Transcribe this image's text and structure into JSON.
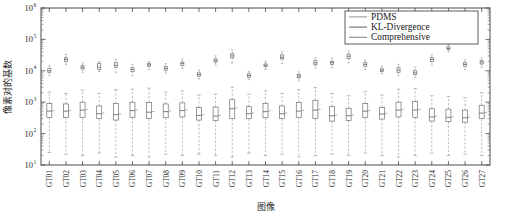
{
  "chart_data": {
    "type": "box",
    "title": "",
    "xlabel": "图像",
    "ylabel": "像素对的基数",
    "yscale": "log",
    "ylim": [
      10,
      1000000
    ],
    "ytick_labels": [
      "10",
      "10",
      "10",
      "10",
      "10",
      "10"
    ],
    "ytick_exponents": [
      "1",
      "2",
      "3",
      "4",
      "5",
      "6"
    ],
    "ytick_values": [
      10,
      100,
      1000,
      10000,
      100000,
      1000000
    ],
    "grid": false,
    "legend_position": "top-right",
    "legend": [
      {
        "label": "PDMS",
        "color": "#9a9a9a"
      },
      {
        "label": "KL-Divergence",
        "color": "#6e6e6e"
      },
      {
        "label": "Comprehensive",
        "color": "#8c8c8c"
      }
    ],
    "categories": [
      "GT01",
      "GT02",
      "GT03",
      "GT04",
      "GT05",
      "GT06",
      "GT07",
      "GT08",
      "GT09",
      "GT10",
      "GT11",
      "GT12",
      "GT13",
      "GT14",
      "GT15",
      "GT16",
      "GT17",
      "GT18",
      "GT19",
      "GT20",
      "GT21",
      "GT22",
      "GT23",
      "GT24",
      "GT25",
      "GT26",
      "GT27"
    ],
    "series": [
      {
        "name": "PDMS",
        "note": "upper cluster near 1e4",
        "boxes": [
          {
            "category": "GT01",
            "lower_whisker": 7000,
            "q1": 9000,
            "median": 10000,
            "q3": 12000,
            "upper_whisker": 15000
          },
          {
            "category": "GT02",
            "lower_whisker": 16000,
            "q1": 20000,
            "median": 23000,
            "q3": 26000,
            "upper_whisker": 33000
          },
          {
            "category": "GT03",
            "lower_whisker": 9000,
            "q1": 11500,
            "median": 13000,
            "q3": 14500,
            "upper_whisker": 18000
          },
          {
            "category": "GT04",
            "lower_whisker": 9500,
            "q1": 11000,
            "median": 13000,
            "q3": 17000,
            "upper_whisker": 20000
          },
          {
            "category": "GT05",
            "lower_whisker": 9000,
            "q1": 13000,
            "median": 15000,
            "q3": 18000,
            "upper_whisker": 23000
          },
          {
            "category": "GT06",
            "lower_whisker": 7000,
            "q1": 9500,
            "median": 11000,
            "q3": 12500,
            "upper_whisker": 16000
          },
          {
            "category": "GT07",
            "lower_whisker": 11000,
            "q1": 14000,
            "median": 15500,
            "q3": 17000,
            "upper_whisker": 20000
          },
          {
            "category": "GT08",
            "lower_whisker": 8500,
            "q1": 10500,
            "median": 12000,
            "q3": 13500,
            "upper_whisker": 17000
          },
          {
            "category": "GT09",
            "lower_whisker": 12000,
            "q1": 15000,
            "median": 17000,
            "q3": 19000,
            "upper_whisker": 24000
          },
          {
            "category": "GT10",
            "lower_whisker": 5500,
            "q1": 6800,
            "median": 7600,
            "q3": 8600,
            "upper_whisker": 10500
          },
          {
            "category": "GT11",
            "lower_whisker": 15000,
            "q1": 19000,
            "median": 21000,
            "q3": 24000,
            "upper_whisker": 30000
          },
          {
            "category": "GT12",
            "lower_whisker": 18000,
            "q1": 26000,
            "median": 30000,
            "q3": 35000,
            "upper_whisker": 46000
          },
          {
            "category": "GT13",
            "lower_whisker": 5200,
            "q1": 6300,
            "median": 7000,
            "q3": 8000,
            "upper_whisker": 9600
          },
          {
            "category": "GT14",
            "lower_whisker": 11000,
            "q1": 13500,
            "median": 15000,
            "q3": 16500,
            "upper_whisker": 20000
          },
          {
            "category": "GT15",
            "lower_whisker": 17000,
            "q1": 24000,
            "median": 27000,
            "q3": 32000,
            "upper_whisker": 40000
          },
          {
            "category": "GT16",
            "lower_whisker": 4800,
            "q1": 6000,
            "median": 6800,
            "q3": 7600,
            "upper_whisker": 9200
          },
          {
            "category": "GT17",
            "lower_whisker": 12000,
            "q1": 15500,
            "median": 18000,
            "q3": 21000,
            "upper_whisker": 26000
          },
          {
            "category": "GT18",
            "lower_whisker": 12500,
            "q1": 16000,
            "median": 18000,
            "q3": 20000,
            "upper_whisker": 25000
          },
          {
            "category": "GT19",
            "lower_whisker": 18000,
            "q1": 25000,
            "median": 29000,
            "q3": 34000,
            "upper_whisker": 43000
          },
          {
            "category": "GT20",
            "lower_whisker": 11000,
            "q1": 14000,
            "median": 16000,
            "q3": 18000,
            "upper_whisker": 22000
          },
          {
            "category": "GT21",
            "lower_whisker": 8000,
            "q1": 9500,
            "median": 10500,
            "q3": 11500,
            "upper_whisker": 14000
          },
          {
            "category": "GT22",
            "lower_whisker": 7000,
            "q1": 9000,
            "median": 10500,
            "q3": 12500,
            "upper_whisker": 16000
          },
          {
            "category": "GT23",
            "lower_whisker": 6000,
            "q1": 7600,
            "median": 8600,
            "q3": 10000,
            "upper_whisker": 13000
          },
          {
            "category": "GT24",
            "lower_whisker": 15000,
            "q1": 20000,
            "median": 23000,
            "q3": 26000,
            "upper_whisker": 33000
          },
          {
            "category": "GT25",
            "lower_whisker": 40000,
            "q1": 48000,
            "median": 52000,
            "q3": 58000,
            "upper_whisker": 70000
          },
          {
            "category": "GT26",
            "lower_whisker": 11000,
            "q1": 14000,
            "median": 16000,
            "q3": 18000,
            "upper_whisker": 22000
          },
          {
            "category": "GT27",
            "lower_whisker": 13000,
            "q1": 16500,
            "median": 19000,
            "q3": 21000,
            "upper_whisker": 26000
          }
        ]
      },
      {
        "name": "KL-Divergence",
        "note": "lower cluster near 1e2-1e3",
        "boxes": [
          {
            "category": "GT01",
            "lower_whisker": 25,
            "q1": 330,
            "median": 520,
            "q3": 900,
            "upper_whisker": 2100
          },
          {
            "category": "GT02",
            "lower_whisker": 22,
            "q1": 330,
            "median": 520,
            "q3": 880,
            "upper_whisker": 1900
          },
          {
            "category": "GT03",
            "lower_whisker": 20,
            "q1": 330,
            "median": 560,
            "q3": 1000,
            "upper_whisker": 2400
          },
          {
            "category": "GT04",
            "lower_whisker": 24,
            "q1": 300,
            "median": 430,
            "q3": 760,
            "upper_whisker": 1900
          },
          {
            "category": "GT05",
            "lower_whisker": 18,
            "q1": 270,
            "median": 400,
            "q3": 900,
            "upper_whisker": 2500
          },
          {
            "category": "GT06",
            "lower_whisker": 20,
            "q1": 330,
            "median": 540,
            "q3": 1000,
            "upper_whisker": 2600
          },
          {
            "category": "GT07",
            "lower_whisker": 18,
            "q1": 300,
            "median": 480,
            "q3": 980,
            "upper_whisker": 2800
          },
          {
            "category": "GT08",
            "lower_whisker": 22,
            "q1": 320,
            "median": 500,
            "q3": 880,
            "upper_whisker": 2100
          },
          {
            "category": "GT09",
            "lower_whisker": 20,
            "q1": 340,
            "median": 540,
            "q3": 950,
            "upper_whisker": 2300
          },
          {
            "category": "GT10",
            "lower_whisker": 22,
            "q1": 270,
            "median": 380,
            "q3": 680,
            "upper_whisker": 1700
          },
          {
            "category": "GT11",
            "lower_whisker": 20,
            "q1": 260,
            "median": 360,
            "q3": 700,
            "upper_whisker": 1800
          },
          {
            "category": "GT12",
            "lower_whisker": 18,
            "q1": 300,
            "median": 620,
            "q3": 1200,
            "upper_whisker": 3000
          },
          {
            "category": "GT13",
            "lower_whisker": 24,
            "q1": 300,
            "median": 430,
            "q3": 720,
            "upper_whisker": 1800
          },
          {
            "category": "GT14",
            "lower_whisker": 20,
            "q1": 320,
            "median": 500,
            "q3": 920,
            "upper_whisker": 2300
          },
          {
            "category": "GT15",
            "lower_whisker": 22,
            "q1": 300,
            "median": 430,
            "q3": 760,
            "upper_whisker": 1900
          },
          {
            "category": "GT16",
            "lower_whisker": 18,
            "q1": 330,
            "median": 520,
            "q3": 980,
            "upper_whisker": 2500
          },
          {
            "category": "GT17",
            "lower_whisker": 20,
            "q1": 300,
            "median": 560,
            "q3": 1150,
            "upper_whisker": 2900
          },
          {
            "category": "GT18",
            "lower_whisker": 22,
            "q1": 250,
            "median": 370,
            "q3": 720,
            "upper_whisker": 1900
          },
          {
            "category": "GT19",
            "lower_whisker": 20,
            "q1": 260,
            "median": 370,
            "q3": 640,
            "upper_whisker": 1600
          },
          {
            "category": "GT20",
            "lower_whisker": 24,
            "q1": 330,
            "median": 520,
            "q3": 900,
            "upper_whisker": 2200
          },
          {
            "category": "GT21",
            "lower_whisker": 20,
            "q1": 290,
            "median": 420,
            "q3": 680,
            "upper_whisker": 1700
          },
          {
            "category": "GT22",
            "lower_whisker": 18,
            "q1": 340,
            "median": 560,
            "q3": 1000,
            "upper_whisker": 2600
          },
          {
            "category": "GT23",
            "lower_whisker": 20,
            "q1": 330,
            "median": 560,
            "q3": 1050,
            "upper_whisker": 2700
          },
          {
            "category": "GT24",
            "lower_whisker": 24,
            "q1": 250,
            "median": 340,
            "q3": 620,
            "upper_whisker": 1600
          },
          {
            "category": "GT25",
            "lower_whisker": 20,
            "q1": 240,
            "median": 330,
            "q3": 600,
            "upper_whisker": 1500
          },
          {
            "category": "GT26",
            "lower_whisker": 22,
            "q1": 230,
            "median": 320,
            "q3": 560,
            "upper_whisker": 1400
          },
          {
            "category": "GT27",
            "lower_whisker": 20,
            "q1": 300,
            "median": 450,
            "q3": 800,
            "upper_whisker": 2000
          }
        ]
      }
    ]
  }
}
